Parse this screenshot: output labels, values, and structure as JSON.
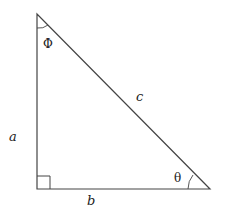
{
  "diagram": {
    "type": "right-triangle",
    "vertices": {
      "top": [
        37,
        14
      ],
      "right_angle": [
        37,
        189
      ],
      "bottom_right": [
        210,
        189
      ]
    },
    "sides": {
      "vertical": "a",
      "horizontal": "b",
      "hypotenuse": "c"
    },
    "angles": {
      "top": "Φ",
      "bottom_right": "θ"
    },
    "colors": {
      "stroke": "#444444",
      "text": "#222222"
    }
  }
}
